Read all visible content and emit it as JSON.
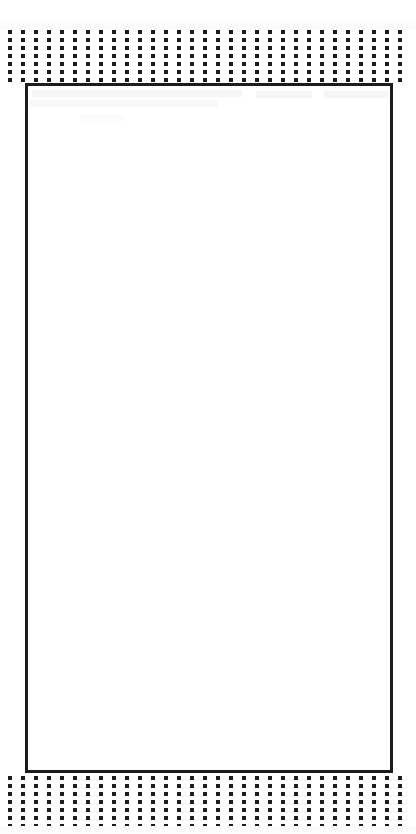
{
  "page": {
    "kind": "scanned-document-page",
    "width": 416,
    "height": 834,
    "background_color": "#ffffff",
    "ink_color": "#1c1c1c",
    "caption": ""
  },
  "frame": {
    "name": "ruled-box",
    "x": 25,
    "y": 83,
    "width": 368,
    "height": 690,
    "border_width_px": 3,
    "border_color": "#1c1c1c",
    "interior_text": "",
    "interior_note": ""
  },
  "combs": {
    "column_count": 31,
    "column_spacing_px": 13,
    "first_column_x": 8,
    "dash_length_px": 4,
    "dash_gap_px": 4,
    "dash_width_px": 4,
    "dash_color": "#1c1c1c",
    "top": {
      "name": "top-perforation-comb",
      "y": 30,
      "height": 54
    },
    "bottom": {
      "name": "bottom-perforation-comb",
      "y": 776,
      "height": 50
    }
  },
  "ghost_marks": {
    "note": "",
    "color": "#f4f4f4"
  }
}
